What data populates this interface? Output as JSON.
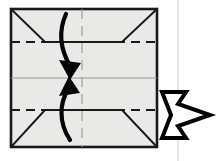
{
  "figure": {
    "type": "origami-folding-diagram",
    "title": "Origami step: fold top and bottom edges to the horizontal center line",
    "canvas": {
      "width": 219,
      "height": 161
    },
    "background_color": "#ffffff"
  },
  "paper": {
    "name": "square-sheet",
    "fill_color": "#e9e9e7",
    "outline_color": "#1a1a1a",
    "outline_width": 2.6,
    "corners": {
      "top_left": [
        11,
        9
      ],
      "top_right": [
        157,
        9
      ],
      "bottom_right": [
        157,
        147
      ],
      "bottom_left": [
        11,
        147
      ]
    }
  },
  "flaps": {
    "name": "folded-corner-flaps",
    "edge_color": "#1a1a1a",
    "edge_width": 1.9,
    "top_flap_points": "11,9 157,9 157,42 122,42 45,42 11,42",
    "top_left_diagonal": [
      11,
      9,
      45,
      42
    ],
    "top_right_diagonal": [
      157,
      9,
      122,
      42
    ],
    "top_flat_edge": [
      45,
      42,
      122,
      42
    ],
    "bottom_left_diagonal": [
      11,
      147,
      45,
      110
    ],
    "bottom_right_diagonal": [
      157,
      147,
      122,
      110
    ],
    "bottom_flat_edge": [
      45,
      110,
      122,
      110
    ]
  },
  "fold_lines": {
    "valley_upper": {
      "label": "upper-valley-fold",
      "y": 42,
      "x1": 11,
      "x2": 157,
      "style": "dashed",
      "color": "#1a1a1a",
      "width": 2.0,
      "dash": "9 6"
    },
    "valley_lower": {
      "label": "lower-valley-fold",
      "y": 110,
      "x1": 11,
      "x2": 157,
      "style": "dashed",
      "color": "#1a1a1a",
      "width": 2.0,
      "dash": "9 6"
    },
    "center_horizontal": {
      "label": "horizontal-center-crease",
      "y": 78,
      "x1": 11,
      "x2": 157,
      "style": "solid",
      "color": "#9a9a98",
      "width": 1.1
    },
    "center_vertical": {
      "label": "vertical-center-crease",
      "x": 82,
      "y1": 9,
      "y2": 147,
      "style": "dashed",
      "color": "#9a9a98",
      "width": 1.1,
      "dash": "10 7"
    }
  },
  "motion_arrows": {
    "color": "#050505",
    "upper": {
      "name": "fold-down-arrow",
      "description": "curved arrow from top edge sweeping down to center",
      "path": "M 66 14 C 57 34, 62 52, 70 66",
      "width": 4.2,
      "head": "70,80 60,61 80,64"
    },
    "lower": {
      "name": "fold-up-arrow",
      "description": "curved arrow from bottom edge sweeping up to center",
      "path": "M 70 140 C 58 122, 60 102, 68 90",
      "width": 4.2,
      "head": "69,76 60,95 79,93"
    }
  },
  "next_step_arrow": {
    "name": "next-step-arrow",
    "description": "hollow double-notched arrow pointing right",
    "points": "160,93 186,93 179,115 210,115 179,137 186,116 160,116 170,105",
    "fill": "#ffffff",
    "stroke": "#000000",
    "stroke_width": 4
  },
  "scan_artifact": {
    "name": "scan-seam-line",
    "x": 178,
    "y1": 0,
    "y2": 161,
    "color": "#e6e6e6",
    "width": 2
  }
}
